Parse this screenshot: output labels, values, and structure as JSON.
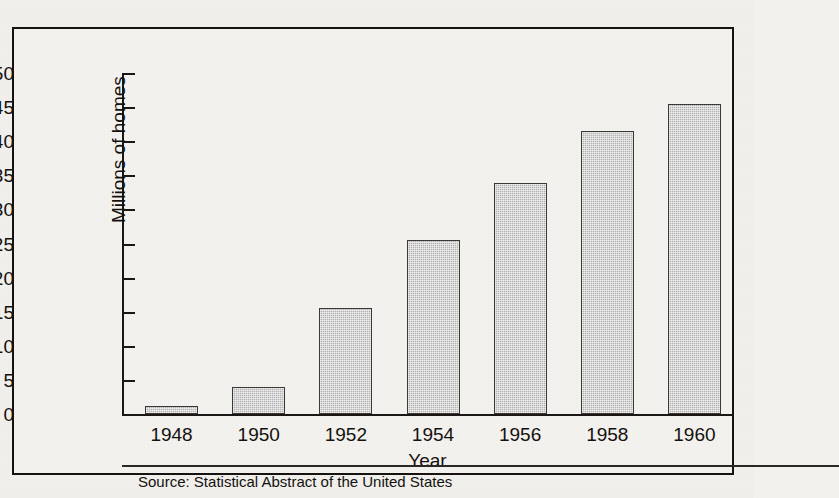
{
  "figure": {
    "title": "",
    "source_note": "Source: Statistical Abstract of the United States"
  },
  "chart_data": {
    "type": "bar",
    "title": "",
    "xlabel": "Year",
    "ylabel": "Millions of homes",
    "categories": [
      "1948",
      "1950",
      "1952",
      "1954",
      "1956",
      "1958",
      "1960"
    ],
    "values": [
      1.2,
      3.9,
      15.6,
      25.5,
      33.8,
      41.5,
      45.5
    ],
    "ylim": [
      0,
      50
    ],
    "yticks": [
      0,
      5,
      10,
      15,
      20,
      25,
      30,
      35,
      40,
      45,
      50
    ],
    "ytick_labels": [
      "0",
      "5",
      "10",
      "15",
      "20",
      "25",
      "30",
      "35",
      "40",
      "45",
      "50"
    ],
    "grid": false,
    "legend": false,
    "bar_fill_color": "#b5b5b5",
    "bar_border_color": "#3b3835",
    "axis_color": "#1a1714"
  }
}
